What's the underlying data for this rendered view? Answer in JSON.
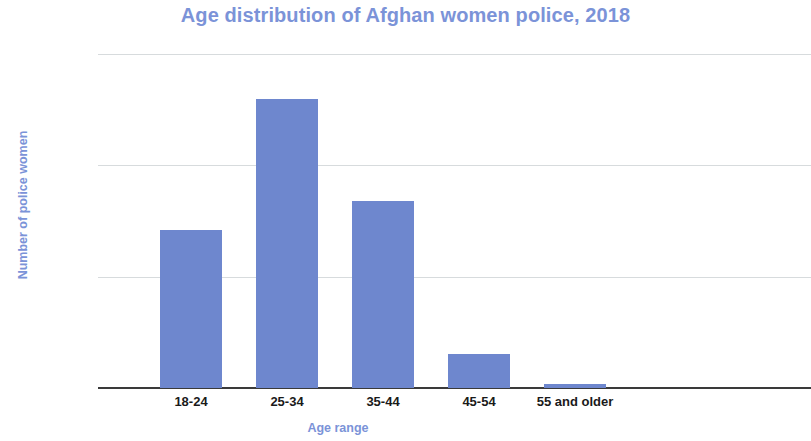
{
  "chart_data": {
    "type": "bar",
    "title": "Age distribution of Afghan women police, 2018",
    "xlabel": "Age range",
    "ylabel": "Number of police women",
    "categories": [
      "18-24",
      "25-34",
      "35-44",
      "45-54",
      "55 and older"
    ],
    "values": [
      710,
      1300,
      840,
      155,
      20
    ],
    "ylim": [
      0,
      1500
    ],
    "yticks": [
      0,
      500,
      1000,
      1500
    ],
    "ytick_labels": [
      "0",
      "500",
      "1000",
      "1500"
    ],
    "grid": "horizontal",
    "legend": "none",
    "bar_color": "#6e87ce",
    "title_color": "#7b93d8",
    "axis_label_color": "#7b93d8",
    "gridline_color": "#d7dbdd",
    "axis_line_color": "#3a3a3a",
    "background_color": "#ffffff"
  }
}
